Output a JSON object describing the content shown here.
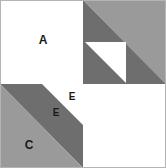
{
  "figure": {
    "width": 166,
    "height": 168,
    "center_x": 83,
    "center_y": 84,
    "colors": {
      "background": "#ffffff",
      "light_gray": "#9a9a9a",
      "dark_gray": "#6e6e6e",
      "border": "#b4b4b4",
      "label_text": "#1a1a1a"
    },
    "labels": [
      {
        "id": "A",
        "text": "A",
        "x": 43,
        "y": 41,
        "size": "large",
        "on": "white-square"
      },
      {
        "id": "E-upper",
        "text": "E",
        "x": 72,
        "y": 97,
        "size": "small",
        "on": "dark-gray"
      },
      {
        "id": "E-lower",
        "text": "E",
        "x": 56,
        "y": 113,
        "size": "small",
        "on": "white-triangle"
      },
      {
        "id": "C",
        "text": "C",
        "x": 29,
        "y": 146,
        "size": "large",
        "on": "light-gray"
      }
    ],
    "quadrants": {
      "top_left": {
        "name": "square-a",
        "fill": "#ffffff",
        "points": "0,0 83,0 83,84 0,84"
      },
      "top_right": {
        "name": "square-b",
        "dark_triangle_points": "83,0 166,84 83,84",
        "light_triangle_points": "83,0 166,0 166,84",
        "white_triangle_points": "85,42 126,42 126,83"
      },
      "bottom_left": {
        "name": "square-c",
        "light_triangle_points": "0,84 83,168 0,168",
        "dark_triangle_points": "0,84 83,84 83,168",
        "white_triangle_points": "42,84 83,84 83,125"
      },
      "bottom_right": {
        "name": "square-d",
        "fill": "#ffffff",
        "points": "83,84 166,84 166,168 83,168"
      }
    }
  }
}
